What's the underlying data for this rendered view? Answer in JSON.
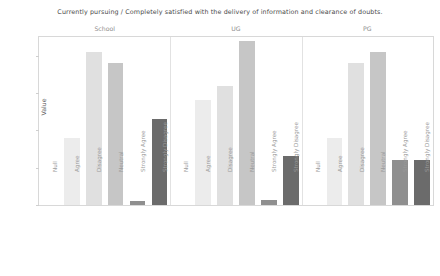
{
  "chart_data": {
    "type": "bar",
    "title": "Currently pursuing / Completely satisfied with the delivery of information and clearance of doubts.",
    "xlabel": "",
    "ylabel": "Value",
    "ylim": [
      0,
      22.5
    ],
    "yticks": [
      0,
      5,
      10,
      15,
      20
    ],
    "ytick_labels": [
      "0",
      "5",
      "10",
      "15",
      "20"
    ],
    "grid": false,
    "legend": "none",
    "facet_by": "Currently pursuing",
    "facets": [
      "School",
      "UG",
      "PG"
    ],
    "categories": [
      "Null",
      "Agree",
      "Disagree",
      "Neutral",
      "Strongly Agree",
      "Strongly Disagree"
    ],
    "bar_colors": [
      "#fbfbfb",
      "#ececec",
      "#e0e0e0",
      "#c6c6c6",
      "#8f8f8f",
      "#6b6b6b"
    ],
    "series": [
      {
        "name": "School",
        "values": [
          0,
          9,
          20.5,
          19,
          0.5,
          11.5
        ]
      },
      {
        "name": "UG",
        "values": [
          0,
          14,
          16,
          22,
          0.7,
          6.5
        ]
      },
      {
        "name": "PG",
        "values": [
          0,
          9,
          19,
          20.5,
          6,
          6
        ]
      }
    ]
  },
  "colors": {
    "frame": "#d8d8d8",
    "axis_text": "#8a8a8a",
    "title_text": "#4a4a4a",
    "strip_text": "#8e8e8e",
    "background": "#ffffff"
  }
}
